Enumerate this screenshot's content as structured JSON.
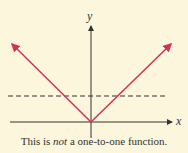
{
  "figure": {
    "axis_labels": {
      "x": "x",
      "y": "y"
    },
    "caption": {
      "before": "This is ",
      "emphasis": "not",
      "after": " a one-to-one function."
    },
    "colors": {
      "background": "#fbf6dc",
      "graph": "#d6305a",
      "axes": "#333333",
      "dashed": "#333333"
    }
  }
}
